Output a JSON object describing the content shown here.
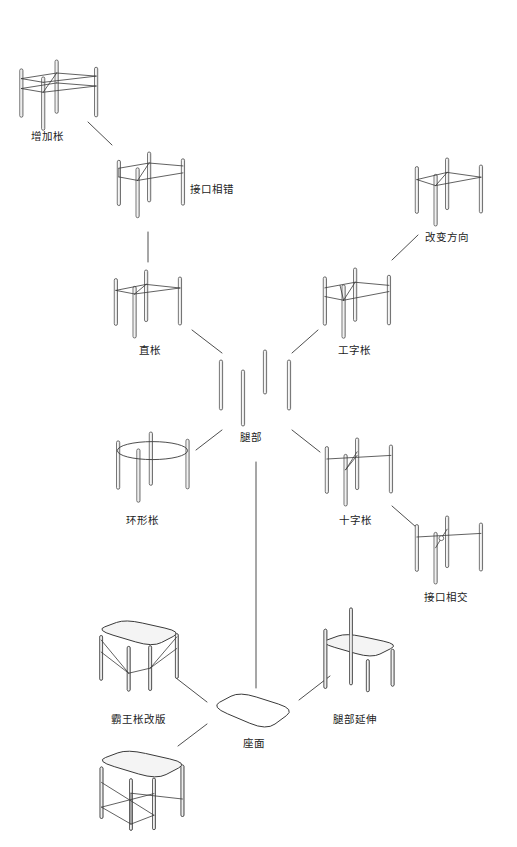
{
  "diagram": {
    "title": "",
    "background_color": "#ffffff",
    "line_color": "#3a3a3a",
    "fill_color": "#f4f4f4",
    "text_color": "#1c1c1c",
    "root": {
      "id": "legs",
      "label": "腿部",
      "label_x": 240,
      "label_y": 432,
      "x": 255,
      "y": 388
    },
    "nodes": [
      {
        "id": "add-stretcher",
        "label": "增加枨",
        "label_x": 31,
        "label_y": 131,
        "fig_x": 18,
        "fig_y": 60,
        "fig_w": 84,
        "fig_h": 62,
        "type": "frame-double-stretcher"
      },
      {
        "id": "staggered-joint",
        "label": "接口相错",
        "label_x": 190,
        "label_y": 184,
        "fig_x": 116,
        "fig_y": 152,
        "fig_w": 72,
        "fig_h": 58,
        "type": "frame-staggered"
      },
      {
        "id": "straight-stretcher",
        "label": "直枨",
        "label_x": 139,
        "label_y": 345,
        "fig_x": 113,
        "fig_y": 270,
        "fig_w": 72,
        "fig_h": 60,
        "type": "frame-straight"
      },
      {
        "id": "ring-stretcher",
        "label": "环形枨",
        "label_x": 126,
        "label_y": 515,
        "fig_x": 115,
        "fig_y": 432,
        "fig_w": 78,
        "fig_h": 62,
        "type": "frame-ring"
      },
      {
        "id": "i-stretcher",
        "label": "工字枨",
        "label_x": 338,
        "label_y": 345,
        "fig_x": 322,
        "fig_y": 268,
        "fig_w": 72,
        "fig_h": 62,
        "type": "frame-i-shape"
      },
      {
        "id": "change-direction",
        "label": "改变方向",
        "label_x": 425,
        "label_y": 232,
        "fig_x": 414,
        "fig_y": 158,
        "fig_w": 72,
        "fig_h": 60,
        "type": "frame-direction"
      },
      {
        "id": "cross-stretcher",
        "label": "十字枨",
        "label_x": 339,
        "label_y": 515,
        "fig_x": 324,
        "fig_y": 438,
        "fig_w": 72,
        "fig_h": 60,
        "type": "frame-cross"
      },
      {
        "id": "intersecting-joint",
        "label": "接口相交",
        "label_x": 424,
        "label_y": 592,
        "fig_x": 414,
        "fig_y": 516,
        "fig_w": 72,
        "fig_h": 60,
        "type": "frame-intersect"
      },
      {
        "id": "seat-surface",
        "label": "座面",
        "label_x": 243,
        "label_y": 738,
        "fig_x": 211,
        "fig_y": 690,
        "fig_w": 84,
        "fig_h": 42,
        "type": "seat"
      },
      {
        "id": "king-stretcher-revised",
        "label": "霸王枨改版",
        "label_x": 111,
        "label_y": 714,
        "fig_x": 96,
        "fig_y": 618,
        "fig_w": 86,
        "fig_h": 72,
        "type": "stool-brace"
      },
      {
        "id": "leg-extension",
        "label": "腿部延伸",
        "label_x": 333,
        "label_y": 714,
        "fig_x": 319,
        "fig_y": 608,
        "fig_w": 80,
        "fig_h": 80,
        "type": "stool-tall-legs"
      },
      {
        "id": "x-brace-stool",
        "label": "",
        "label_x": 0,
        "label_y": 0,
        "fig_x": 96,
        "fig_y": 748,
        "fig_w": 92,
        "fig_h": 78,
        "type": "stool-x-brace"
      }
    ],
    "edges": [
      {
        "id": "edge-legs-straight",
        "x1": 222,
        "y1": 353,
        "x2": 192,
        "y2": 330
      },
      {
        "id": "edge-legs-ring",
        "x1": 222,
        "y1": 430,
        "x2": 196,
        "y2": 450
      },
      {
        "id": "edge-legs-i",
        "x1": 292,
        "y1": 353,
        "x2": 318,
        "y2": 330
      },
      {
        "id": "edge-legs-cross",
        "x1": 292,
        "y1": 430,
        "x2": 320,
        "y2": 452
      },
      {
        "id": "edge-straight-staggered",
        "x1": 148,
        "y1": 262,
        "x2": 148,
        "y2": 232
      },
      {
        "id": "edge-staggered-add",
        "x1": 112,
        "y1": 145,
        "x2": 88,
        "y2": 122
      },
      {
        "id": "edge-i-direction",
        "x1": 392,
        "y1": 260,
        "x2": 418,
        "y2": 235
      },
      {
        "id": "edge-cross-intersect",
        "x1": 392,
        "y1": 506,
        "x2": 416,
        "y2": 527
      },
      {
        "id": "edge-legs-seat",
        "x1": 256,
        "y1": 462,
        "x2": 256,
        "y2": 688
      },
      {
        "id": "edge-seat-king",
        "x1": 207,
        "y1": 702,
        "x2": 176,
        "y2": 678
      },
      {
        "id": "edge-seat-extension",
        "x1": 299,
        "y1": 700,
        "x2": 330,
        "y2": 676
      },
      {
        "id": "edge-seat-xbrace",
        "x1": 207,
        "y1": 724,
        "x2": 178,
        "y2": 746
      }
    ]
  }
}
